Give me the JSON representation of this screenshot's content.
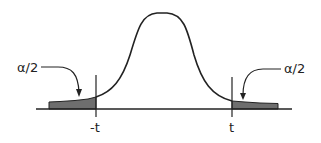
{
  "diagram": {
    "title": "",
    "curve": "t-distribution bell curve with two shaded tails",
    "labels": {
      "left_tail": "α/2",
      "right_tail": "α/2",
      "left_critical": "-t",
      "right_critical": "t"
    },
    "colors": {
      "line": "#222222",
      "shade": "#6e6e6e",
      "background": "#ffffff"
    }
  }
}
